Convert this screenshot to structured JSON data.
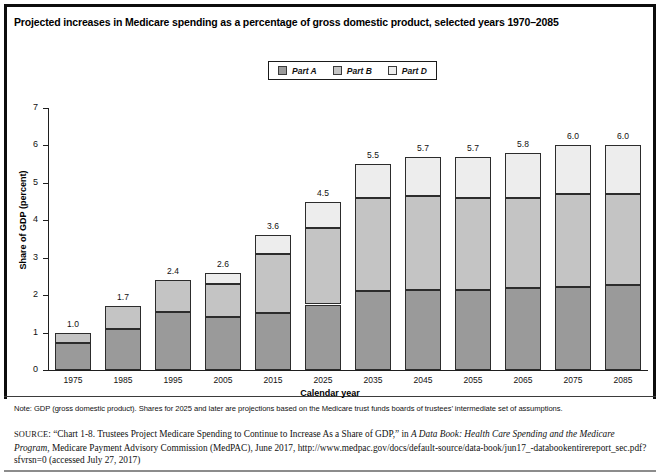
{
  "figure": {
    "title": "Projected increases in Medicare spending as a percentage of gross domestic product, selected years 1970–2085",
    "note": "Note: GDP (gross domestic product). Shares for 2025 and later are projections based on the Medicare trust funds boards of trustees’ intermediate set of assumptions.",
    "source_prefix": "SOURCE",
    "source_p1": ": “Chart 1-8. Trustees Project Medicare Spending to Continue to Increase As a Share of GDP,” in ",
    "source_italic1": "A Data Book: Health Care Spending and the Medicare Program",
    "source_p2": ", Medicare Payment Advisory Commission (MedPAC), June 2017, http://www.medpac.gov/docs/default-source/data-book/jun17_-databookentirereport_sec.pdf?sfvrsn=0 (accessed July 27, 2017)"
  },
  "colors": {
    "part_a": "#9a9a9a",
    "part_b": "#c4c4c4",
    "part_d": "#ededed",
    "outline": "#2c2c2c",
    "frame": "#0d0d0d",
    "text": "#111111"
  },
  "legend": {
    "items": [
      {
        "label": "Part A",
        "swatch": "legend-swatch-part-a",
        "color": "#9a9a9a"
      },
      {
        "label": "Part B",
        "swatch": "legend-swatch-part-b",
        "color": "#c4c4c4"
      },
      {
        "label": "Part D",
        "swatch": "legend-swatch-part-d",
        "color": "#ededed"
      }
    ]
  },
  "chart_data": {
    "type": "bar",
    "subtype": "stacked-vertical",
    "title": "Projected increases in Medicare spending as a percentage of gross domestic product, selected years 1970–2085",
    "xlabel": "Calendar year",
    "ylabel": "Share of GDP (percent)",
    "ylim": [
      0,
      7
    ],
    "yticks": [
      0,
      1,
      2,
      3,
      4,
      5,
      6,
      7
    ],
    "grid": false,
    "legend_position": "top-center",
    "categories": [
      "1975",
      "1985",
      "1995",
      "2005",
      "2015",
      "2025",
      "2035",
      "2045",
      "2055",
      "2065",
      "2075",
      "2085"
    ],
    "series": [
      {
        "name": "Part A",
        "color": "#9a9a9a",
        "values": [
          0.73,
          1.1,
          1.55,
          1.42,
          1.53,
          1.75,
          2.1,
          2.15,
          2.15,
          2.18,
          2.22,
          2.27
        ]
      },
      {
        "name": "Part B",
        "color": "#c4c4c4",
        "values": [
          0.27,
          0.6,
          0.85,
          0.88,
          1.57,
          2.05,
          2.5,
          2.5,
          2.45,
          2.42,
          2.48,
          2.43
        ]
      },
      {
        "name": "Part D",
        "color": "#ededed",
        "values": [
          0.0,
          0.0,
          0.0,
          0.3,
          0.5,
          0.7,
          0.9,
          1.05,
          1.1,
          1.2,
          1.3,
          1.3
        ]
      }
    ],
    "totals": [
      1.0,
      1.7,
      2.4,
      2.6,
      3.6,
      4.5,
      5.5,
      5.7,
      5.7,
      5.8,
      6.0,
      6.0
    ],
    "data_labels": [
      "1.0",
      "1.7",
      "2.4",
      "2.6",
      "3.6",
      "4.5",
      "5.5",
      "5.7",
      "5.7",
      "5.8",
      "6.0",
      "6.0"
    ]
  }
}
